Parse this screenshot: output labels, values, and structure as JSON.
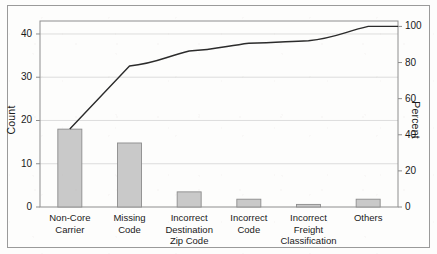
{
  "chart_data": {
    "type": "bar",
    "title": "",
    "subtitle": "",
    "xlabel": "",
    "ylabel": "Count",
    "y2label": "Percent",
    "grid": true,
    "legend": "none",
    "categories": [
      "Non-Core\nCarrier",
      "Missing\nCode",
      "Incorrect\nDestination\nZip Code",
      "Incorrect\nCode",
      "Incorrect\nFreight\nClassification",
      "Others"
    ],
    "values": [
      18,
      14.8,
      3.5,
      1.8,
      0.6,
      1.8
    ],
    "ylim": [
      0,
      43
    ],
    "y_ticks": [
      0,
      10,
      20,
      30,
      40
    ],
    "y2lim": [
      0,
      103
    ],
    "y2_ticks": [
      0,
      20,
      40,
      60,
      80,
      100
    ],
    "series": [
      {
        "name": "Count",
        "type": "bar",
        "values": [
          18,
          14.8,
          3.5,
          1.8,
          0.6,
          1.8
        ]
      },
      {
        "name": "Cumulative Percent",
        "type": "line",
        "axis": "y2",
        "values": [
          42.9,
          78.1,
          86.4,
          90.7,
          92.1,
          100.0
        ]
      }
    ],
    "bar_color": "#c9c9c9",
    "bar_edge_color": "#8c8c8c",
    "line_color": "#2b2b2b",
    "grid_color": "#d4d4d4",
    "axis_color": "#8e8e8e"
  },
  "axes": {
    "left_title": "Count",
    "right_title": "Percent",
    "left_ticks": [
      "40",
      "30",
      "20",
      "10",
      "0"
    ],
    "right_ticks": [
      "100",
      "80",
      "60",
      "40",
      "20",
      "0"
    ]
  },
  "categories": [
    {
      "label": "Non-Core\nCarrier"
    },
    {
      "label": "Missing\nCode"
    },
    {
      "label": "Incorrect\nDestination\nZip Code"
    },
    {
      "label": "Incorrect\nCode"
    },
    {
      "label": "Incorrect\nFreight\nClassification"
    },
    {
      "label": "Others"
    }
  ]
}
